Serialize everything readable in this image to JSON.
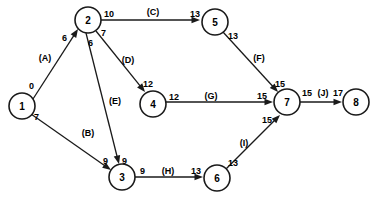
{
  "diagram": {
    "type": "activity-on-arrow-network",
    "title": "",
    "background_color": "#ffffff",
    "line_color": "#1a1a1a",
    "text_color": "#000000",
    "nodes": [
      {
        "id": "1",
        "label": "1",
        "cx": 22,
        "cy": 106,
        "r": 13
      },
      {
        "id": "2",
        "label": "2",
        "cx": 88,
        "cy": 20,
        "r": 13
      },
      {
        "id": "3",
        "label": "3",
        "cx": 122,
        "cy": 177,
        "r": 13
      },
      {
        "id": "4",
        "label": "4",
        "cx": 153,
        "cy": 104,
        "r": 13
      },
      {
        "id": "5",
        "label": "5",
        "cx": 215,
        "cy": 22,
        "r": 13
      },
      {
        "id": "6",
        "label": "6",
        "cx": 217,
        "cy": 178,
        "r": 13
      },
      {
        "id": "7",
        "label": "7",
        "cx": 287,
        "cy": 102,
        "r": 13
      },
      {
        "id": "8",
        "label": "8",
        "cx": 356,
        "cy": 102,
        "r": 13
      }
    ],
    "edges": [
      {
        "id": "edge-A",
        "activity": "(A)",
        "from": "1",
        "to": "2",
        "x1": 33,
        "y1": 99,
        "x2": 78,
        "y2": 29,
        "activity_x": 45,
        "activity_y": 58,
        "tail_value": "0",
        "tail_x": 29,
        "tail_y": 86,
        "head_value": "6",
        "head_x": 62,
        "head_y": 38
      },
      {
        "id": "edge-B",
        "activity": "(B)",
        "from": "1",
        "to": "3",
        "x1": 31,
        "y1": 114,
        "x2": 111,
        "y2": 170,
        "activity_x": 88,
        "activity_y": 133,
        "tail_value": "7",
        "tail_x": 34,
        "tail_y": 117,
        "head_value": "9",
        "head_x": 103,
        "head_y": 161
      },
      {
        "id": "edge-C",
        "activity": "(C)",
        "from": "2",
        "to": "5",
        "x1": 101,
        "y1": 20,
        "x2": 200,
        "y2": 20,
        "activity_x": 153,
        "activity_y": 12,
        "tail_value": "10",
        "tail_x": 104,
        "tail_y": 14,
        "head_value": "13",
        "head_x": 190,
        "head_y": 14
      },
      {
        "id": "edge-D",
        "activity": "(D)",
        "from": "2",
        "to": "4",
        "x1": 96,
        "y1": 31,
        "x2": 145,
        "y2": 92,
        "activity_x": 128,
        "activity_y": 60,
        "tail_value": "7",
        "tail_x": 101,
        "tail_y": 33,
        "head_value": "12",
        "head_x": 143,
        "head_y": 84
      },
      {
        "id": "edge-E",
        "activity": "(E)",
        "from": "2",
        "to": "3",
        "x1": 86,
        "y1": 33,
        "x2": 119,
        "y2": 164,
        "activity_x": 115,
        "activity_y": 101,
        "tail_value": "6",
        "tail_x": 88,
        "tail_y": 43,
        "head_value": "9",
        "head_x": 122,
        "head_y": 161
      },
      {
        "id": "edge-F",
        "activity": "(F)",
        "from": "5",
        "to": "7",
        "x1": 223,
        "y1": 32,
        "x2": 278,
        "y2": 92,
        "activity_x": 259,
        "activity_y": 58,
        "tail_value": "13",
        "tail_x": 228,
        "tail_y": 36,
        "head_value": "15",
        "head_x": 275,
        "head_y": 84
      },
      {
        "id": "edge-G",
        "activity": "(G)",
        "from": "4",
        "to": "7",
        "x1": 166,
        "y1": 102,
        "x2": 273,
        "y2": 102,
        "activity_x": 211,
        "activity_y": 96,
        "tail_value": "12",
        "tail_x": 169,
        "tail_y": 97,
        "head_value": "15",
        "head_x": 257,
        "head_y": 96
      },
      {
        "id": "edge-H",
        "activity": "(H)",
        "from": "3",
        "to": "6",
        "x1": 135,
        "y1": 177,
        "x2": 203,
        "y2": 177,
        "activity_x": 168,
        "activity_y": 171,
        "tail_value": "9",
        "tail_x": 140,
        "tail_y": 171,
        "head_value": "13",
        "head_x": 191,
        "head_y": 171
      },
      {
        "id": "edge-I",
        "activity": "(I)",
        "from": "6",
        "to": "7",
        "x1": 226,
        "y1": 169,
        "x2": 280,
        "y2": 115,
        "activity_x": 244,
        "activity_y": 143,
        "tail_value": "13",
        "tail_x": 228,
        "tail_y": 163,
        "head_value": "15",
        "head_x": 262,
        "head_y": 120
      },
      {
        "id": "edge-J",
        "activity": "(J)",
        "from": "7",
        "to": "8",
        "x1": 300,
        "y1": 102,
        "x2": 342,
        "y2": 102,
        "activity_x": 323,
        "activity_y": 93,
        "tail_value": "15",
        "tail_x": 302,
        "tail_y": 93,
        "head_value": "17",
        "head_x": 333,
        "head_y": 93
      }
    ]
  }
}
